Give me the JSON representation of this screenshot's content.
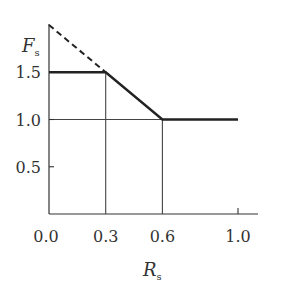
{
  "chart_data": {
    "type": "line",
    "title": "",
    "xlabel": "R_s",
    "ylabel": "F_s",
    "xlabel_main": "R",
    "xlabel_sub": "s",
    "ylabel_main": "F",
    "ylabel_sub": "s",
    "xlim": [
      0.0,
      1.0
    ],
    "ylim": [
      0.0,
      2.0
    ],
    "x_ticks": [
      0.0,
      0.3,
      0.6,
      1.0
    ],
    "x_tick_labels": [
      "0.0",
      "0.3",
      "0.6",
      "1.0"
    ],
    "y_ticks": [
      0.5,
      1.0,
      1.5
    ],
    "y_tick_labels": [
      "0.5",
      "1.0",
      "1.5"
    ],
    "grid": false,
    "legend": null,
    "series": [
      {
        "name": "Fs (solid)",
        "style": "solid",
        "color": "#222222",
        "x": [
          0.0,
          0.3,
          0.6,
          1.0
        ],
        "y": [
          1.5,
          1.5,
          1.0,
          1.0
        ]
      },
      {
        "name": "extrapolation (dashed)",
        "style": "dashed",
        "color": "#222222",
        "x": [
          0.0,
          0.3
        ],
        "y": [
          2.0,
          1.5
        ]
      }
    ],
    "reference_lines": [
      {
        "type": "vertical",
        "x": 0.3,
        "from_y": 0.0,
        "to_y": 1.5
      },
      {
        "type": "vertical",
        "x": 0.6,
        "from_y": 0.0,
        "to_y": 1.0
      },
      {
        "type": "horizontal",
        "y": 1.0,
        "from_x": 0.0,
        "to_x": 0.6
      }
    ]
  }
}
